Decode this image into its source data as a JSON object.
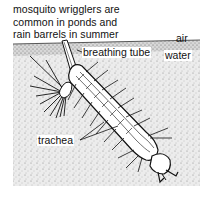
{
  "diagram": {
    "caption_lines": [
      "mosquito wrigglers are",
      "common in ponds and",
      "rain barrels in summer"
    ],
    "labels": {
      "air": "air",
      "water": "water",
      "breathing_tube": "breathing tube",
      "trachea": "trachea"
    },
    "colors": {
      "ink": "#111111",
      "water_stipple_bg": "#e6e6e6",
      "paper": "#ffffff"
    }
  }
}
